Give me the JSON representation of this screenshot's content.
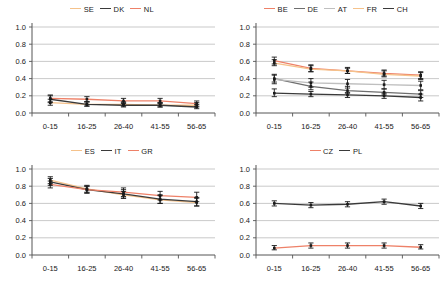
{
  "figure": {
    "layout": "2x2 grid of line charts",
    "panel_order": [
      "nordic",
      "western",
      "southern",
      "central"
    ]
  },
  "axis": {
    "y_ticks": [
      "0.0",
      "0.2",
      "0.4",
      "0.6",
      "0.8",
      "1.0"
    ],
    "x_ticks": [
      "0-15",
      "16-25",
      "26-40",
      "41-55",
      "56-65"
    ],
    "ylim": [
      0,
      1
    ],
    "ytick_step": 0.2
  },
  "colors": {
    "orange_light": "#F5C28B",
    "orange": "#E8873B",
    "salmon": "#EE8168",
    "dark_gray": "#3A3A3A",
    "mid_gray": "#6E6E6E",
    "light_gray": "#BFBFBF",
    "grid": "#BBBBBB",
    "axis": "#555555",
    "errorbar": "#1A1A1A"
  },
  "chart_data": [
    {
      "type": "line",
      "id": "nordic",
      "title": "",
      "xlabel": "",
      "ylabel": "",
      "categories": [
        "0-15",
        "16-25",
        "26-40",
        "41-55",
        "56-65"
      ],
      "ylim": [
        0,
        1
      ],
      "grid": true,
      "legend_position": "top-center",
      "series": [
        {
          "name": "SE",
          "color": "#F5C28B",
          "values": [
            0.12,
            0.1,
            0.1,
            0.09,
            0.09
          ],
          "err_low": [
            0.09,
            0.08,
            0.08,
            0.07,
            0.07
          ],
          "err_high": [
            0.16,
            0.13,
            0.13,
            0.12,
            0.12
          ]
        },
        {
          "name": "DK",
          "color": "#3A3A3A",
          "values": [
            0.16,
            0.1,
            0.09,
            0.09,
            0.07
          ],
          "err_low": [
            0.12,
            0.08,
            0.07,
            0.07,
            0.05
          ],
          "err_high": [
            0.2,
            0.13,
            0.12,
            0.12,
            0.1
          ]
        },
        {
          "name": "NL",
          "color": "#EE8168",
          "values": [
            0.17,
            0.16,
            0.14,
            0.14,
            0.11
          ],
          "err_low": [
            0.13,
            0.13,
            0.11,
            0.11,
            0.08
          ],
          "err_high": [
            0.21,
            0.19,
            0.17,
            0.17,
            0.14
          ]
        }
      ]
    },
    {
      "type": "line",
      "id": "western",
      "title": "",
      "xlabel": "",
      "ylabel": "",
      "categories": [
        "0-15",
        "16-25",
        "26-40",
        "41-55",
        "56-65"
      ],
      "ylim": [
        0,
        1
      ],
      "grid": true,
      "legend_position": "top-center",
      "series": [
        {
          "name": "BE",
          "color": "#EE8168",
          "values": [
            0.61,
            0.52,
            0.49,
            0.46,
            0.44
          ],
          "err_low": [
            0.57,
            0.48,
            0.46,
            0.43,
            0.4
          ],
          "err_high": [
            0.65,
            0.56,
            0.53,
            0.5,
            0.48
          ]
        },
        {
          "name": "DE",
          "color": "#6E6E6E",
          "values": [
            0.4,
            0.31,
            0.26,
            0.24,
            0.22
          ],
          "err_low": [
            0.36,
            0.27,
            0.23,
            0.21,
            0.18
          ],
          "err_high": [
            0.45,
            0.36,
            0.31,
            0.28,
            0.26
          ]
        },
        {
          "name": "AT",
          "color": "#BFBFBF",
          "values": [
            0.39,
            0.35,
            0.34,
            0.33,
            0.32
          ],
          "err_low": [
            0.34,
            0.3,
            0.29,
            0.28,
            0.27
          ],
          "err_high": [
            0.44,
            0.4,
            0.39,
            0.38,
            0.37
          ]
        },
        {
          "name": "FR",
          "color": "#F5C28B",
          "values": [
            0.58,
            0.51,
            0.49,
            0.45,
            0.43
          ],
          "err_low": [
            0.55,
            0.48,
            0.46,
            0.42,
            0.39
          ],
          "err_high": [
            0.62,
            0.55,
            0.52,
            0.49,
            0.47
          ]
        },
        {
          "name": "CH",
          "color": "#3A3A3A",
          "values": [
            0.23,
            0.22,
            0.21,
            0.2,
            0.18
          ],
          "err_low": [
            0.19,
            0.19,
            0.18,
            0.17,
            0.14
          ],
          "err_high": [
            0.28,
            0.25,
            0.24,
            0.23,
            0.22
          ]
        }
      ]
    },
    {
      "type": "line",
      "id": "southern",
      "title": "",
      "xlabel": "",
      "ylabel": "",
      "categories": [
        "0-15",
        "16-25",
        "26-40",
        "41-55",
        "56-65"
      ],
      "ylim": [
        0,
        1
      ],
      "grid": true,
      "legend_position": "top-center",
      "series": [
        {
          "name": "ES",
          "color": "#F5C28B",
          "values": [
            0.87,
            0.77,
            0.7,
            0.64,
            0.61
          ],
          "err_low": [
            0.83,
            0.73,
            0.66,
            0.6,
            0.57
          ],
          "err_high": [
            0.91,
            0.81,
            0.74,
            0.69,
            0.66
          ]
        },
        {
          "name": "IT",
          "color": "#3A3A3A",
          "values": [
            0.85,
            0.76,
            0.71,
            0.65,
            0.62
          ],
          "err_low": [
            0.81,
            0.72,
            0.66,
            0.6,
            0.57
          ],
          "err_high": [
            0.89,
            0.8,
            0.76,
            0.7,
            0.67
          ]
        },
        {
          "name": "GR",
          "color": "#EE8168",
          "values": [
            0.82,
            0.76,
            0.73,
            0.69,
            0.67
          ],
          "err_low": [
            0.78,
            0.72,
            0.68,
            0.64,
            0.62
          ],
          "err_high": [
            0.86,
            0.8,
            0.78,
            0.74,
            0.73
          ]
        }
      ]
    },
    {
      "type": "line",
      "id": "central",
      "title": "",
      "xlabel": "",
      "ylabel": "",
      "categories": [
        "0-15",
        "16-25",
        "26-40",
        "41-55",
        "56-65"
      ],
      "ylim": [
        0,
        1
      ],
      "grid": true,
      "legend_position": "top-center",
      "series": [
        {
          "name": "CZ",
          "color": "#EE8168",
          "values": [
            0.08,
            0.11,
            0.11,
            0.11,
            0.09
          ],
          "err_low": [
            0.06,
            0.08,
            0.08,
            0.08,
            0.07
          ],
          "err_high": [
            0.11,
            0.14,
            0.14,
            0.14,
            0.12
          ]
        },
        {
          "name": "PL",
          "color": "#3A3A3A",
          "values": [
            0.6,
            0.58,
            0.59,
            0.62,
            0.57
          ],
          "err_low": [
            0.57,
            0.55,
            0.56,
            0.59,
            0.54
          ],
          "err_high": [
            0.63,
            0.61,
            0.62,
            0.65,
            0.6
          ]
        }
      ]
    }
  ]
}
